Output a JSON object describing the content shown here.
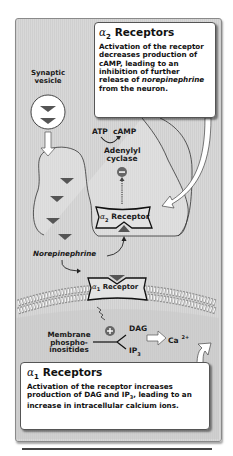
{
  "alpha2_callout": {
    "title_symbol": "α",
    "title_subscript": "2",
    "title_text": "Receptors",
    "body_part1": "Activation of the receptor decreases production of cAMP, leading to an inhibition of further release of ",
    "body_italic": "norepinephrine",
    "body_part2": " from the neuron."
  },
  "alpha1_callout": {
    "title_symbol": "α",
    "title_subscript": "1",
    "title_text": "Receptors",
    "body_part1": "Activation of the receptor increases production of DAG and IP",
    "body_sub": "3",
    "body_part2": ", leading to an increase in intracellular calcium ions."
  },
  "labels": {
    "synaptic_vesicle": "Synaptic vesicle",
    "atp": "ATP",
    "camp": "cAMP",
    "adenylyl_cyclase": "Adenylyl cyclase",
    "alpha2_receptor_symbol": "α",
    "alpha2_receptor_sub": "2",
    "alpha2_receptor_text": "Receptor",
    "norepinephrine": "Norepinephrine",
    "alpha1_receptor_symbol": "α",
    "alpha1_receptor_sub": "1",
    "alpha1_receptor_text": "Receptor",
    "membrane_phosphoinositides": "Membrane phospho- inositides",
    "dag": "DAG",
    "ip": "IP",
    "ip_sub": "3",
    "ca": "Ca",
    "ca_sup": "2+",
    "inhibit_sign": "−",
    "activate_sign": "+"
  },
  "colors": {
    "panel_bg": "#d4d4d4",
    "neurotransmitter": "#555555",
    "callout_bg": "#ffffff",
    "text": "#111111"
  }
}
